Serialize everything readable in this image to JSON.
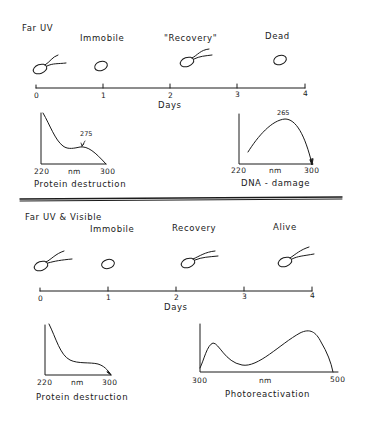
{
  "top_panel": {
    "title": "Far UV",
    "stages": [
      {
        "label": "Immobile",
        "day": 1
      },
      {
        "label": "\"Recovery\"",
        "day": 2.3
      },
      {
        "label": "Dead",
        "day": 3.6
      }
    ],
    "cells": [
      {
        "day": 0.3,
        "state": "flagellated"
      },
      {
        "day": 1.0,
        "state": "non-flagellated"
      },
      {
        "day": 2.4,
        "state": "flagellated"
      },
      {
        "day": 3.65,
        "state": "non-flagellated"
      }
    ],
    "timeline": {
      "ticks": [
        "0",
        "1",
        "2",
        "3",
        "4"
      ],
      "axis_label": "Days"
    },
    "spectra": [
      {
        "caption": "Protein destruction",
        "x_min": "220",
        "x_unit": "nm",
        "x_max": "300",
        "annotation": "275"
      },
      {
        "caption": "DNA - damage",
        "x_min": "220",
        "x_unit": "nm",
        "x_max": "300",
        "annotation": "265"
      }
    ]
  },
  "bottom_panel": {
    "title": "Far UV & Visible",
    "stages": [
      {
        "label": "Immobile",
        "day": 1
      },
      {
        "label": "Recovery",
        "day": 2.2
      },
      {
        "label": "Alive",
        "day": 3.6
      }
    ],
    "cells": [
      {
        "day": 0.3,
        "state": "flagellated"
      },
      {
        "day": 1.0,
        "state": "non-flagellated"
      },
      {
        "day": 2.4,
        "state": "flagellated"
      },
      {
        "day": 3.8,
        "state": "flagellated"
      }
    ],
    "timeline": {
      "ticks": [
        "0",
        "1",
        "2",
        "3",
        "4"
      ],
      "axis_label": "Days"
    },
    "spectra": [
      {
        "caption": "Protein destruction",
        "x_min": "220",
        "x_unit": "nm",
        "x_max": "300"
      },
      {
        "caption": "Photoreactivation",
        "x_min": "300",
        "x_unit": "nm",
        "x_max": "500"
      }
    ]
  },
  "colors": {
    "ink": "#1a1a1a",
    "background": "#ffffff",
    "separator": "#333333"
  }
}
